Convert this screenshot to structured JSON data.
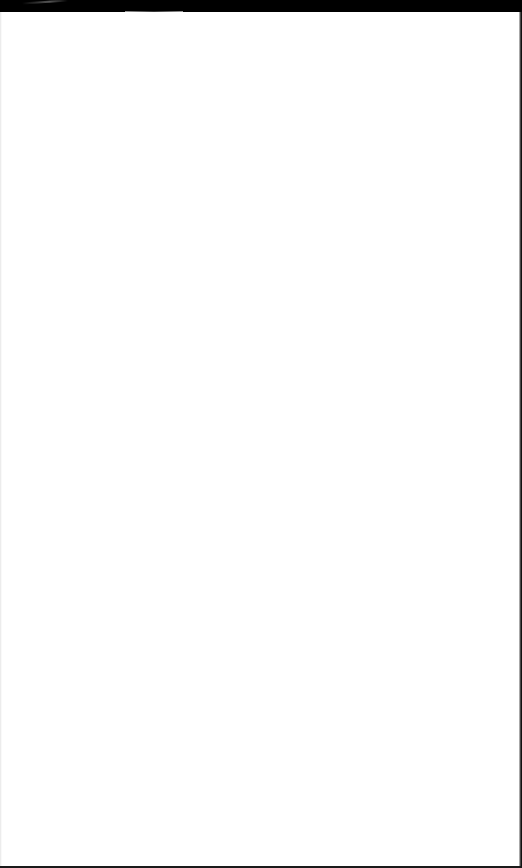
{
  "screen": {
    "description": "",
    "background_color": "#ffffff",
    "frame_color": "#000000"
  }
}
